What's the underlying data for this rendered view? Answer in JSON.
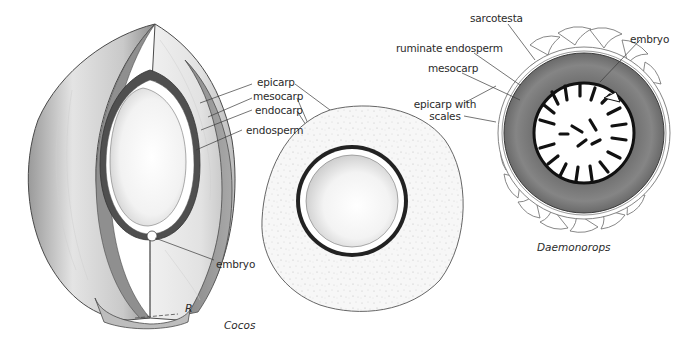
{
  "figures": [
    {
      "id": "cocos-fruit",
      "caption": "Cocos",
      "labels": {
        "epicarp": "epicarp",
        "mesocarp": "mesocarp",
        "endocarp": "endocarp",
        "endosperm": "endosperm",
        "embryo": "embryo"
      },
      "signature": "R"
    },
    {
      "id": "daemonorops-fruit",
      "caption": "Daemonorops",
      "labels": {
        "sarcotesta": "sarcotesta",
        "ruminate_endosperm": "ruminate endosperm",
        "mesocarp": "mesocarp",
        "epicarp_line1": "epicarp with",
        "epicarp_line2": "scales",
        "embryo": "embryo"
      }
    }
  ],
  "colors": {
    "ink": "#2b2b2b",
    "husk_light": "#e6e6e6",
    "husk_mid": "#b5b5b5",
    "husk_dark": "#8a8a8a",
    "sarcotesta_gray": "#7d7d7d",
    "endosperm_white": "#ffffff",
    "speckle": "#f4f4f4"
  }
}
